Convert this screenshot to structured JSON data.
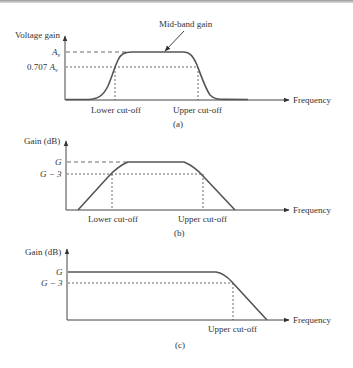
{
  "figure": {
    "panels": [
      {
        "id": "a",
        "caption": "(a)",
        "y_axis_label": "Voltage gain",
        "x_axis_label": "Frequency",
        "y_levels": [
          "A_v",
          "0.707 A_v"
        ],
        "y_level_main": "A",
        "y_level_sub": "v",
        "y_level_707": "0.707 ",
        "annotation": "Mid-band gain",
        "x_markers": [
          "Lower cut-off",
          "Upper cut-off"
        ],
        "curve": "smooth band-pass"
      },
      {
        "id": "b",
        "caption": "(b)",
        "y_axis_label": "Gain (dB)",
        "x_axis_label": "Frequency",
        "y_levels": [
          "G",
          "G − 3"
        ],
        "y_level_g": "G",
        "y_level_g3": "G − 3",
        "x_markers": [
          "Lower cut-off",
          "Upper cut-off"
        ],
        "curve": "piecewise-linear band-pass"
      },
      {
        "id": "c",
        "caption": "(c)",
        "y_axis_label": "Gain (dB)",
        "x_axis_label": "Frequency",
        "y_levels": [
          "G",
          "G − 3"
        ],
        "y_level_g": "G",
        "y_level_g3": "G − 3",
        "x_markers": [
          "Upper cut-off"
        ],
        "curve": "low-pass (flat then roll-off)"
      }
    ]
  }
}
